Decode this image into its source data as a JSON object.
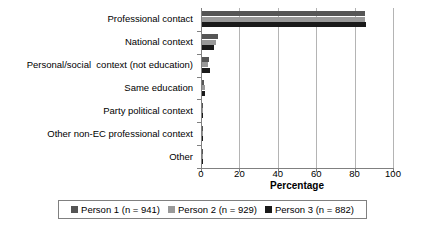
{
  "chart_data": {
    "type": "bar",
    "orientation": "horizontal",
    "title": "",
    "xlabel": "Percentage",
    "ylabel": "",
    "xlim": [
      0,
      100
    ],
    "xticks": [
      0,
      20,
      40,
      60,
      80,
      100
    ],
    "grid": true,
    "legend_position": "bottom",
    "categories": [
      "Professional contact",
      "National context",
      "Personal/social  context (not education)",
      "Same education",
      "Party political context",
      "Other non-EC professional context",
      "Other"
    ],
    "series": [
      {
        "name": "Person 1 (n = 941)",
        "color": "#555555",
        "values": [
          85.0,
          8.5,
          3.5,
          1.2,
          0.6,
          0.2,
          0.2
        ]
      },
      {
        "name": "Person 2 (n = 929)",
        "color": "#999999",
        "values": [
          85.0,
          7.5,
          3.0,
          1.5,
          0.5,
          0.2,
          0.2
        ]
      },
      {
        "name": "Person 3 (n = 882)",
        "color": "#1a1a1a",
        "values": [
          85.5,
          6.5,
          4.0,
          1.8,
          0.5,
          0.2,
          0.2
        ]
      }
    ]
  },
  "axis": {
    "tick_labels": [
      "0",
      "20",
      "40",
      "60",
      "80",
      "100"
    ],
    "title": "Percentage"
  },
  "legend": {
    "items": [
      {
        "label": "Person 1 (n = 941)",
        "color": "#555555"
      },
      {
        "label": "Person 2 (n = 929)",
        "color": "#999999"
      },
      {
        "label": "Person 3 (n = 882)",
        "color": "#1a1a1a"
      }
    ]
  }
}
